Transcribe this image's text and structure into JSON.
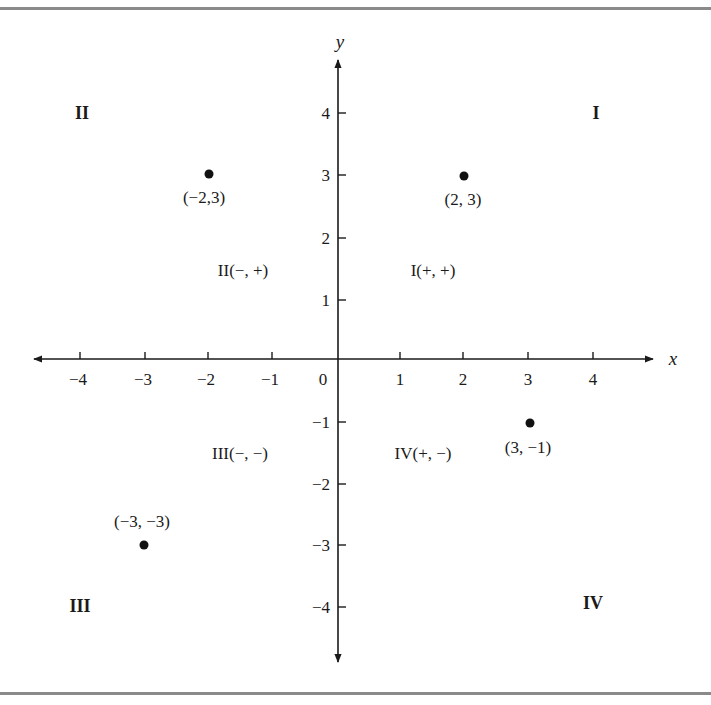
{
  "figure": {
    "x_axis_label": "x",
    "y_axis_label": "y",
    "origin_label": "0",
    "x_ticks": [
      {
        "value": -4,
        "label": "−4",
        "px": 80
      },
      {
        "value": -3,
        "label": "−3",
        "px": 145
      },
      {
        "value": -2,
        "label": "−2",
        "px": 208
      },
      {
        "value": -1,
        "label": "−1",
        "px": 272
      },
      {
        "value": 1,
        "label": "1",
        "px": 400
      },
      {
        "value": 2,
        "label": "2",
        "px": 463
      },
      {
        "value": 3,
        "label": "3",
        "px": 528
      },
      {
        "value": 4,
        "label": "4",
        "px": 593
      }
    ],
    "y_ticks": [
      {
        "value": 4,
        "label": "4",
        "px": 113
      },
      {
        "value": 3,
        "label": "3",
        "px": 175
      },
      {
        "value": 2,
        "label": "2",
        "px": 238
      },
      {
        "value": 1,
        "label": "1",
        "px": 300
      },
      {
        "value": -1,
        "label": "−1",
        "px": 422
      },
      {
        "value": -2,
        "label": "−2",
        "px": 484
      },
      {
        "value": -3,
        "label": "−3",
        "px": 545
      },
      {
        "value": -4,
        "label": "−4",
        "px": 607
      }
    ],
    "quadrant_names": {
      "I": "I",
      "II": "II",
      "III": "III",
      "IV": "IV"
    },
    "quadrant_signs": {
      "I": "I(+, +)",
      "II": "II(−, +)",
      "III": "III(−, −)",
      "IV": "IV(+, −)"
    },
    "points": [
      {
        "x": -2,
        "y": 3,
        "label": "(−2,3)"
      },
      {
        "x": 2,
        "y": 3,
        "label": "(2, 3)"
      },
      {
        "x": 3,
        "y": -1,
        "label": "(3, −1)"
      },
      {
        "x": -3,
        "y": -3,
        "label": "(−3, −3)"
      }
    ],
    "colors": {
      "ink": "#1a1a1a",
      "frame": "#8a8a8a"
    }
  }
}
